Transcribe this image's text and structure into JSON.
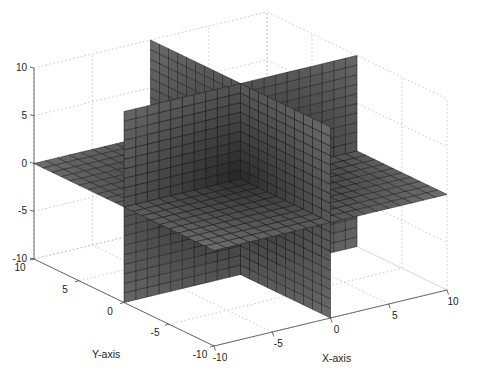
{
  "chart_data": {
    "type": "surface-slices-3d",
    "title": "",
    "xlabel": "X-axis",
    "ylabel": "Y-axis",
    "zlabel": "",
    "xlim": [
      -10,
      10
    ],
    "ylim": [
      -10,
      10
    ],
    "zlim": [
      -10,
      10
    ],
    "xticks": [
      -10,
      -5,
      0,
      5,
      10
    ],
    "yticks": [
      -10,
      -5,
      0,
      5,
      10
    ],
    "zticks": [
      -10,
      -5,
      0,
      5,
      10
    ],
    "xtick_labels": [
      "-10",
      "-5",
      "0",
      "5",
      "10"
    ],
    "ytick_labels": [
      "-10",
      "-5",
      "0",
      "5",
      "10"
    ],
    "ztick_labels": [
      "-10",
      "-5",
      "0",
      "5",
      "10"
    ],
    "grid": true,
    "colormap": "gray",
    "grid_step": 1,
    "slices": [
      {
        "name": "x-slice",
        "axis": "x",
        "value": 0
      },
      {
        "name": "y-slice",
        "axis": "y",
        "value": 0
      },
      {
        "name": "z-slice",
        "axis": "z",
        "value": 0
      }
    ],
    "view": "default 3D (azimuth -37.5, elevation 30)"
  }
}
